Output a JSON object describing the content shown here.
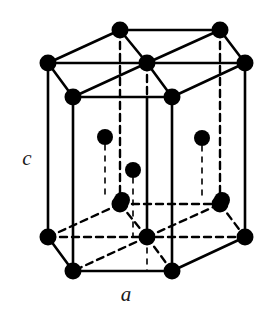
{
  "figure": {
    "background_color": "#ffffff",
    "stroke_color": "#000000",
    "atom_color": "#000000",
    "width": 274,
    "height": 315
  },
  "labels": {
    "lattice_parameter_c": "c",
    "lattice_parameter_a": "a",
    "c_position": {
      "x": 27,
      "y": 160
    },
    "a_position": {
      "x": 126,
      "y": 296
    }
  },
  "geometry": {
    "atom_radius": 8.5,
    "atom_radius_interior": 8.0,
    "solid_stroke_width": 2.6,
    "dashed_stroke_width": 2.4,
    "dashed_thin_stroke_width": 1.6,
    "dash_pattern": "7,5",
    "dash_pattern_thin": "5,6"
  },
  "atoms": {
    "top_layer": [
      {
        "name": "top-back-left",
        "x": 120,
        "y": 30,
        "kind": "corner"
      },
      {
        "name": "top-back-right",
        "x": 220,
        "y": 30,
        "kind": "corner"
      },
      {
        "name": "top-left",
        "x": 48,
        "y": 63,
        "kind": "corner"
      },
      {
        "name": "top-center",
        "x": 147,
        "y": 63,
        "kind": "center"
      },
      {
        "name": "top-right",
        "x": 245,
        "y": 63,
        "kind": "corner"
      },
      {
        "name": "top-front-left",
        "x": 73,
        "y": 97,
        "kind": "corner"
      },
      {
        "name": "top-front-right",
        "x": 172,
        "y": 97,
        "kind": "corner"
      }
    ],
    "middle_layer": [
      {
        "name": "mid-left",
        "x": 105,
        "y": 137,
        "kind": "interior"
      },
      {
        "name": "mid-right",
        "x": 202,
        "y": 138,
        "kind": "interior"
      },
      {
        "name": "mid-center",
        "x": 133,
        "y": 170,
        "kind": "interior"
      },
      {
        "name": "mid-front-left",
        "x": 122,
        "y": 200,
        "kind": "interior"
      },
      {
        "name": "mid-front-right",
        "x": 222,
        "y": 200,
        "kind": "interior"
      }
    ],
    "bottom_layer": [
      {
        "name": "bottom-back-left",
        "x": 120,
        "y": 204,
        "kind": "corner"
      },
      {
        "name": "bottom-back-right",
        "x": 220,
        "y": 204,
        "kind": "corner"
      },
      {
        "name": "bottom-left",
        "x": 48,
        "y": 237,
        "kind": "corner"
      },
      {
        "name": "bottom-center",
        "x": 147,
        "y": 237,
        "kind": "center"
      },
      {
        "name": "bottom-right",
        "x": 245,
        "y": 237,
        "kind": "corner"
      },
      {
        "name": "bottom-front-left",
        "x": 73,
        "y": 271,
        "kind": "corner"
      },
      {
        "name": "bottom-front-right",
        "x": 172,
        "y": 271,
        "kind": "corner"
      }
    ],
    "total_count": 19
  },
  "edges": {
    "solid": [
      {
        "name": "top-back-left-to-back-right",
        "x1": 120,
        "y1": 30,
        "x2": 220,
        "y2": 30
      },
      {
        "name": "top-left-to-back-left",
        "x1": 48,
        "y1": 63,
        "x2": 120,
        "y2": 30
      },
      {
        "name": "top-back-right-to-right",
        "x1": 220,
        "y1": 30,
        "x2": 245,
        "y2": 63
      },
      {
        "name": "top-left-to-right",
        "x1": 48,
        "y1": 63,
        "x2": 245,
        "y2": 63
      },
      {
        "name": "top-left-to-front-left",
        "x1": 48,
        "y1": 63,
        "x2": 73,
        "y2": 97
      },
      {
        "name": "top-front-left-to-front-right",
        "x1": 73,
        "y1": 97,
        "x2": 172,
        "y2": 97
      },
      {
        "name": "top-front-right-to-right",
        "x1": 172,
        "y1": 97,
        "x2": 245,
        "y2": 63
      },
      {
        "name": "top-center-to-back-left",
        "x1": 147,
        "y1": 63,
        "x2": 120,
        "y2": 30
      },
      {
        "name": "top-center-to-back-right",
        "x1": 147,
        "y1": 63,
        "x2": 220,
        "y2": 30
      },
      {
        "name": "top-center-to-front-left",
        "x1": 147,
        "y1": 63,
        "x2": 73,
        "y2": 97
      },
      {
        "name": "top-center-to-front-right",
        "x1": 147,
        "y1": 63,
        "x2": 172,
        "y2": 97
      },
      {
        "name": "vert-left",
        "x1": 48,
        "y1": 63,
        "x2": 48,
        "y2": 237
      },
      {
        "name": "vert-right",
        "x1": 245,
        "y1": 63,
        "x2": 245,
        "y2": 237
      },
      {
        "name": "vert-front-left",
        "x1": 73,
        "y1": 97,
        "x2": 73,
        "y2": 271
      },
      {
        "name": "vert-front-right",
        "x1": 172,
        "y1": 97,
        "x2": 172,
        "y2": 271
      },
      {
        "name": "vert-center",
        "x1": 147,
        "y1": 97,
        "x2": 147,
        "y2": 237
      },
      {
        "name": "bottom-left-to-front-left",
        "x1": 48,
        "y1": 237,
        "x2": 73,
        "y2": 271
      },
      {
        "name": "bottom-front-left-to-front-right",
        "x1": 73,
        "y1": 271,
        "x2": 172,
        "y2": 271
      },
      {
        "name": "bottom-front-right-to-right",
        "x1": 172,
        "y1": 271,
        "x2": 245,
        "y2": 237
      }
    ],
    "dashed": [
      {
        "name": "bottom-left-to-center",
        "x1": 48,
        "y1": 237,
        "x2": 245,
        "y2": 237
      },
      {
        "name": "bottom-left-to-back-left",
        "x1": 48,
        "y1": 237,
        "x2": 120,
        "y2": 204
      },
      {
        "name": "bottom-back-left-to-back-right",
        "x1": 120,
        "y1": 204,
        "x2": 220,
        "y2": 204
      },
      {
        "name": "bottom-back-right-to-right",
        "x1": 220,
        "y1": 204,
        "x2": 245,
        "y2": 237
      },
      {
        "name": "bottom-center-to-back-left",
        "x1": 147,
        "y1": 237,
        "x2": 120,
        "y2": 204
      },
      {
        "name": "bottom-center-to-back-right",
        "x1": 147,
        "y1": 237,
        "x2": 220,
        "y2": 204
      },
      {
        "name": "bottom-center-to-front-left",
        "x1": 147,
        "y1": 237,
        "x2": 73,
        "y2": 271
      },
      {
        "name": "bottom-center-to-front-right",
        "x1": 147,
        "y1": 237,
        "x2": 172,
        "y2": 271
      },
      {
        "name": "vert-back-left",
        "x1": 120,
        "y1": 30,
        "x2": 120,
        "y2": 204
      },
      {
        "name": "vert-back-right",
        "x1": 220,
        "y1": 30,
        "x2": 220,
        "y2": 204
      },
      {
        "name": "vert-top-center",
        "x1": 147,
        "y1": 63,
        "x2": 147,
        "y2": 97
      }
    ],
    "dashed_thin": [
      {
        "name": "drop-mid-left",
        "x1": 105,
        "y1": 145,
        "x2": 105,
        "y2": 200
      },
      {
        "name": "drop-mid-right",
        "x1": 202,
        "y1": 146,
        "x2": 202,
        "y2": 200
      },
      {
        "name": "drop-mid-center",
        "x1": 133,
        "y1": 178,
        "x2": 133,
        "y2": 237
      },
      {
        "name": "drop-bottom-center",
        "x1": 147,
        "y1": 237,
        "x2": 147,
        "y2": 271
      }
    ]
  }
}
